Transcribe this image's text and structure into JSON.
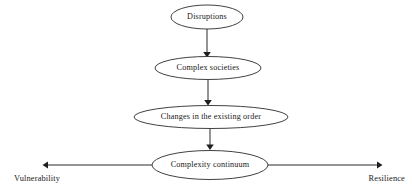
{
  "diagram": {
    "background_color": "#ffffff",
    "stroke_color": "#2b2b2b",
    "text_color": "#1a1a1a",
    "nodes": [
      {
        "id": "disruptions",
        "label": "Disruptions",
        "cx": 207,
        "cy": 17,
        "rx": 36,
        "ry": 12
      },
      {
        "id": "complex-societies",
        "label": "Complex societies",
        "cx": 208,
        "cy": 68,
        "rx": 53,
        "ry": 11.5
      },
      {
        "id": "changes-existing-order",
        "label": "Changes in the existing order",
        "cx": 211,
        "cy": 117,
        "rx": 77,
        "ry": 11.5
      },
      {
        "id": "complexity-continuum",
        "label": "Complexity continuum",
        "cx": 210,
        "cy": 165,
        "rx": 58,
        "ry": 14.5
      }
    ],
    "connectors": [
      {
        "id": "disruptions-to-complex-societies",
        "x": 207,
        "y1": 29,
        "y2": 56
      },
      {
        "id": "complex-societies-to-changes",
        "x": 208,
        "y1": 80,
        "y2": 105
      },
      {
        "id": "changes-to-continuum",
        "x": 210,
        "y1": 129,
        "y2": 149
      }
    ],
    "axis": {
      "y": 165,
      "left_arrow": {
        "from_x": 152,
        "to_x": 43
      },
      "right_arrow": {
        "from_x": 268,
        "to_x": 382
      },
      "left_label": "Vulnerability",
      "right_label": "Resilience",
      "left_label_x": 14,
      "right_label_x": 405,
      "label_y": 180
    }
  }
}
